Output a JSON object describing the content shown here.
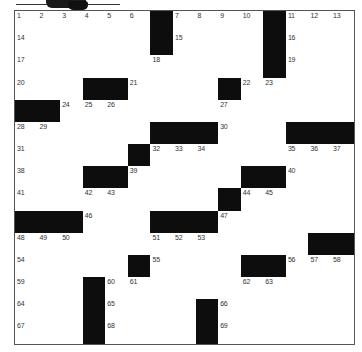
{
  "puzzle": {
    "type": "crossword",
    "rows": 15,
    "cols": 15,
    "grid": [
      "......#....#...",
      "......#....#...",
      "...........#...",
      "...##....#.....",
      "##.............",
      "......###...###",
      ".....#.........",
      "...##.....##...",
      ".........#.....",
      "###...###......",
      ".............##",
      ".....#....##...",
      "...#...........",
      "...#....#......",
      "...#....#......"
    ],
    "numbers": [
      {
        "n": "1",
        "r": 0,
        "c": 0
      },
      {
        "n": "2",
        "r": 0,
        "c": 1
      },
      {
        "n": "3",
        "r": 0,
        "c": 2
      },
      {
        "n": "4",
        "r": 0,
        "c": 3
      },
      {
        "n": "5",
        "r": 0,
        "c": 4
      },
      {
        "n": "6",
        "r": 0,
        "c": 5
      },
      {
        "n": "7",
        "r": 0,
        "c": 7
      },
      {
        "n": "8",
        "r": 0,
        "c": 8
      },
      {
        "n": "9",
        "r": 0,
        "c": 9
      },
      {
        "n": "10",
        "r": 0,
        "c": 10
      },
      {
        "n": "11",
        "r": 0,
        "c": 12
      },
      {
        "n": "12",
        "r": 0,
        "c": 13
      },
      {
        "n": "13",
        "r": 0,
        "c": 14
      },
      {
        "n": "14",
        "r": 1,
        "c": 0
      },
      {
        "n": "15",
        "r": 1,
        "c": 7
      },
      {
        "n": "16",
        "r": 1,
        "c": 12
      },
      {
        "n": "17",
        "r": 2,
        "c": 0
      },
      {
        "n": "18",
        "r": 2,
        "c": 6
      },
      {
        "n": "19",
        "r": 2,
        "c": 12
      },
      {
        "n": "20",
        "r": 3,
        "c": 0
      },
      {
        "n": "21",
        "r": 3,
        "c": 5
      },
      {
        "n": "22",
        "r": 3,
        "c": 10
      },
      {
        "n": "23",
        "r": 3,
        "c": 11
      },
      {
        "n": "24",
        "r": 4,
        "c": 2
      },
      {
        "n": "25",
        "r": 4,
        "c": 3
      },
      {
        "n": "26",
        "r": 4,
        "c": 4
      },
      {
        "n": "27",
        "r": 4,
        "c": 9
      },
      {
        "n": "28",
        "r": 5,
        "c": 0
      },
      {
        "n": "29",
        "r": 5,
        "c": 1
      },
      {
        "n": "30",
        "r": 5,
        "c": 9
      },
      {
        "n": "31",
        "r": 6,
        "c": 0
      },
      {
        "n": "32",
        "r": 6,
        "c": 6
      },
      {
        "n": "33",
        "r": 6,
        "c": 7
      },
      {
        "n": "34",
        "r": 6,
        "c": 8
      },
      {
        "n": "35",
        "r": 6,
        "c": 12
      },
      {
        "n": "36",
        "r": 6,
        "c": 13
      },
      {
        "n": "37",
        "r": 6,
        "c": 14
      },
      {
        "n": "38",
        "r": 7,
        "c": 0
      },
      {
        "n": "39",
        "r": 7,
        "c": 5
      },
      {
        "n": "40",
        "r": 7,
        "c": 12
      },
      {
        "n": "41",
        "r": 8,
        "c": 0
      },
      {
        "n": "42",
        "r": 8,
        "c": 3
      },
      {
        "n": "43",
        "r": 8,
        "c": 4
      },
      {
        "n": "44",
        "r": 8,
        "c": 10
      },
      {
        "n": "45",
        "r": 8,
        "c": 11
      },
      {
        "n": "46",
        "r": 9,
        "c": 3
      },
      {
        "n": "47",
        "r": 9,
        "c": 9
      },
      {
        "n": "48",
        "r": 10,
        "c": 0
      },
      {
        "n": "49",
        "r": 10,
        "c": 1
      },
      {
        "n": "50",
        "r": 10,
        "c": 2
      },
      {
        "n": "51",
        "r": 10,
        "c": 6
      },
      {
        "n": "52",
        "r": 10,
        "c": 7
      },
      {
        "n": "53",
        "r": 10,
        "c": 8
      },
      {
        "n": "54",
        "r": 11,
        "c": 0
      },
      {
        "n": "55",
        "r": 11,
        "c": 6
      },
      {
        "n": "56",
        "r": 11,
        "c": 12
      },
      {
        "n": "57",
        "r": 11,
        "c": 13
      },
      {
        "n": "58",
        "r": 11,
        "c": 14
      },
      {
        "n": "59",
        "r": 12,
        "c": 0
      },
      {
        "n": "60",
        "r": 12,
        "c": 4
      },
      {
        "n": "61",
        "r": 12,
        "c": 5
      },
      {
        "n": "62",
        "r": 12,
        "c": 10
      },
      {
        "n": "63",
        "r": 12,
        "c": 11
      },
      {
        "n": "64",
        "r": 13,
        "c": 0
      },
      {
        "n": "65",
        "r": 13,
        "c": 4
      },
      {
        "n": "66",
        "r": 13,
        "c": 9
      },
      {
        "n": "67",
        "r": 14,
        "c": 0
      },
      {
        "n": "68",
        "r": 14,
        "c": 4
      },
      {
        "n": "69",
        "r": 14,
        "c": 9
      }
    ]
  },
  "colors": {
    "black_cell": "#0d0d0d",
    "white_cell": "#ffffff",
    "grid_line": "#7a7a7a",
    "number_text": "#333333"
  }
}
